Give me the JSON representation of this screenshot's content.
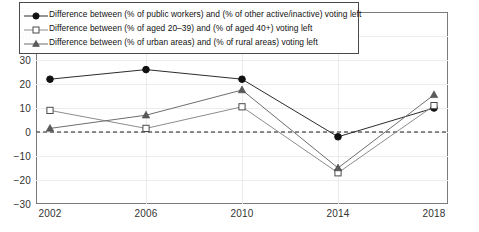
{
  "chart_data": {
    "type": "line",
    "title": "",
    "xlabel": "",
    "ylabel": "",
    "x": [
      2002,
      2006,
      2010,
      2014,
      2018
    ],
    "categories": [
      "2002",
      "2006",
      "2010",
      "2014",
      "2018"
    ],
    "ylim": [
      -30,
      50
    ],
    "yticks": [
      -30,
      -20,
      -10,
      0,
      10,
      20,
      30,
      40,
      50
    ],
    "ytick_labels": [
      "−30",
      "−20",
      "−10",
      "0",
      "10",
      "20",
      "30",
      "40",
      "50"
    ],
    "xticks": [
      2002,
      2006,
      2010,
      2014,
      2018
    ],
    "xtick_labels": [
      "2002",
      "2006",
      "2010",
      "2014",
      "2018"
    ],
    "grid": true,
    "legend_position": "top-left",
    "reference_line": {
      "value": 0,
      "style": "dashed",
      "color": "#1a1a1a"
    },
    "series": [
      {
        "name": "Difference between (% of public workers) and (% of other active/inactive) voting left",
        "marker": "filled-circle",
        "color": "#2b2b2b",
        "values": [
          22,
          26,
          22,
          -2,
          10
        ]
      },
      {
        "name": "Difference between (% of aged 20–39) and (% of aged 40+) voting left",
        "marker": "open-square",
        "color": "#8c8c8c",
        "values": [
          9,
          1.5,
          10.5,
          -17,
          11
        ]
      },
      {
        "name": "Difference between (% of urban areas) and (% of rural areas) voting left",
        "marker": "filled-triangle",
        "color": "#6e6e6e",
        "values": [
          1.5,
          7,
          17.5,
          -15,
          15.5
        ]
      }
    ]
  }
}
